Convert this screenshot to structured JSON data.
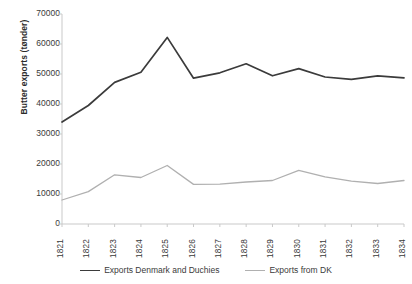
{
  "chart_data": {
    "type": "line",
    "title": "",
    "xlabel": "",
    "ylabel": "Butter exports (tønder)",
    "ylim": [
      0,
      70000
    ],
    "ytick_step": 10000,
    "yticks": [
      70000,
      60000,
      50000,
      40000,
      30000,
      20000,
      10000,
      0
    ],
    "grid": false,
    "legend_position": "bottom",
    "categories": [
      "1821",
      "1822",
      "1823",
      "1824",
      "1825",
      "1826",
      "1827",
      "1828",
      "1829",
      "1830",
      "1831",
      "1832",
      "1833",
      "1834"
    ],
    "series": [
      {
        "name": "Exports Denmark and Duchies",
        "color": "#3b3b3b",
        "values": [
          34000,
          39500,
          47200,
          50600,
          62200,
          48600,
          50400,
          53400,
          49400,
          51800,
          49000,
          48200,
          49400,
          48700
        ]
      },
      {
        "name": "Exports from DK",
        "color": "#b0b0b0",
        "values": [
          8000,
          10800,
          16400,
          15500,
          19500,
          13200,
          13300,
          14000,
          14500,
          17900,
          15700,
          14300,
          13500,
          14500
        ]
      }
    ]
  },
  "axis": {
    "y_title": "Butter exports (tønder)"
  },
  "legend": {
    "items": [
      {
        "label": "Exports Denmark and Duchies"
      },
      {
        "label": "Exports from DK"
      }
    ]
  }
}
